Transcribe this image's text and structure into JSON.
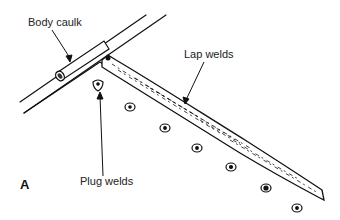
{
  "diagram": {
    "type": "technical-illustration",
    "figure_label": "A",
    "labels": {
      "body_caulk": "Body caulk",
      "lap_welds": "Lap welds",
      "plug_welds": "Plug welds"
    },
    "plug_weld_count": 7,
    "colors": {
      "ink": "#111111",
      "background": "#ffffff"
    }
  }
}
